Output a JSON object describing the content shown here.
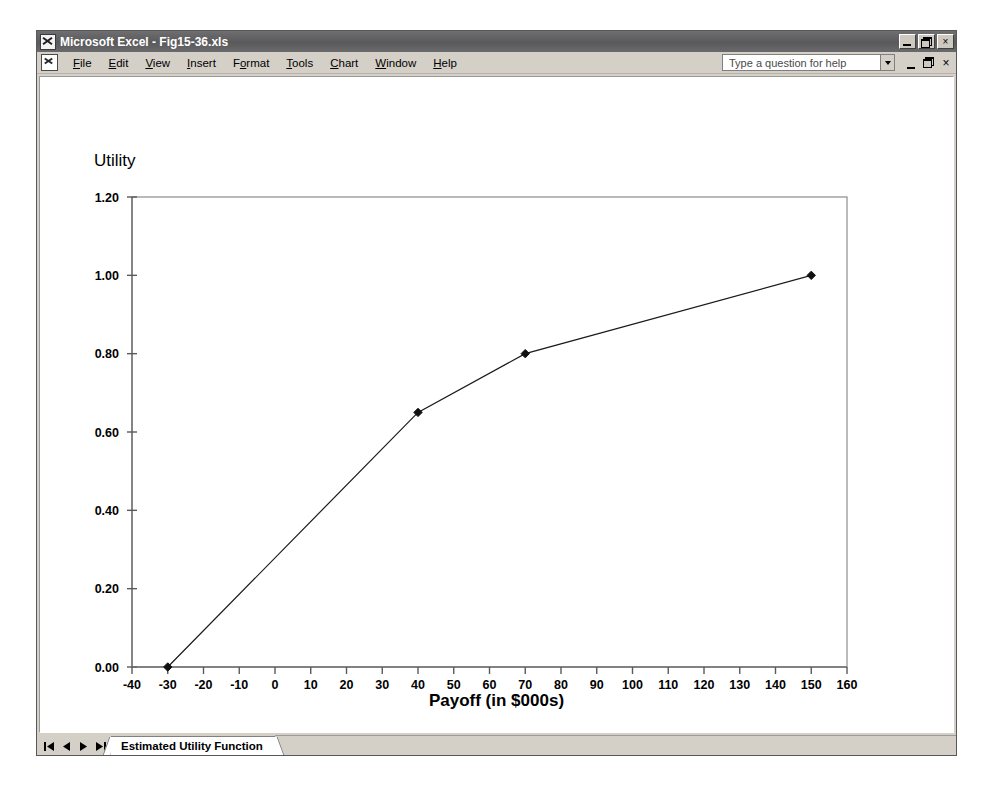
{
  "window": {
    "title": "Microsoft Excel - Fig15-36.xls",
    "app_icon": "excel-icon",
    "title_buttons": {
      "minimize": "minimize-icon",
      "restore": "restore-icon",
      "close": "×"
    },
    "document_buttons": {
      "minimize": "minimize-icon",
      "restore": "restore-icon",
      "close": "×"
    }
  },
  "menu": {
    "items": [
      {
        "label": "File",
        "accel": "F"
      },
      {
        "label": "Edit",
        "accel": "E"
      },
      {
        "label": "View",
        "accel": "V"
      },
      {
        "label": "Insert",
        "accel": "I"
      },
      {
        "label": "Format",
        "accel": "o"
      },
      {
        "label": "Tools",
        "accel": "T"
      },
      {
        "label": "Chart",
        "accel": "C"
      },
      {
        "label": "Window",
        "accel": "W"
      },
      {
        "label": "Help",
        "accel": "H"
      }
    ],
    "help_box": {
      "placeholder": "Type a question for help",
      "value": "",
      "dropdown_icon": "chevron-down-icon"
    }
  },
  "sheet_bar": {
    "nav": {
      "first": "first-sheet-icon",
      "previous": "previous-sheet-icon",
      "next": "next-sheet-icon",
      "last": "last-sheet-icon"
    },
    "tabs": [
      {
        "label": "Estimated Utility Function",
        "active": true
      }
    ]
  },
  "colors": {
    "title_bar": "#5a5a5c",
    "window_face": "#d4d0c8",
    "plot_background": "#ffffff",
    "series_line": "#000000",
    "axis": "#808080"
  },
  "chart_data": {
    "type": "line",
    "title": "",
    "xlabel": "Payoff (in $000s)",
    "ylabel": "Utility",
    "xlim": [
      -40,
      160
    ],
    "ylim": [
      0.0,
      1.2
    ],
    "xticks": [
      -40,
      -30,
      -20,
      -10,
      0,
      10,
      20,
      30,
      40,
      50,
      60,
      70,
      80,
      90,
      100,
      110,
      120,
      130,
      140,
      150,
      160
    ],
    "xtick_labels": [
      "-40",
      "-30",
      "-20",
      "-10",
      "0",
      "10",
      "20",
      "30",
      "40",
      "50",
      "60",
      "70",
      "80",
      "90",
      "100",
      "110",
      "120",
      "130",
      "140",
      "150",
      "160"
    ],
    "yticks": [
      0.0,
      0.2,
      0.4,
      0.6,
      0.8,
      1.0,
      1.2
    ],
    "ytick_labels": [
      "0.00",
      "0.20",
      "0.40",
      "0.60",
      "0.80",
      "1.00",
      "1.20"
    ],
    "grid": false,
    "legend": false,
    "marker": "diamond",
    "series": [
      {
        "name": "Estimated Utility Function",
        "x": [
          -30,
          40,
          70,
          150
        ],
        "y": [
          0.0,
          0.65,
          0.8,
          1.0
        ]
      }
    ]
  }
}
